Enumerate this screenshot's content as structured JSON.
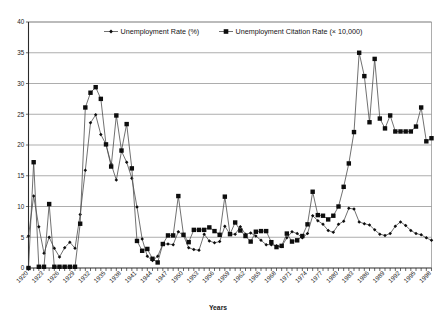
{
  "chart_data": {
    "type": "line",
    "title": "",
    "xlabel": "Years",
    "ylabel": "",
    "xlim": [
      1920,
      1998
    ],
    "ylim": [
      0,
      40
    ],
    "yticks": [
      0,
      5,
      10,
      15,
      20,
      25,
      30,
      35,
      40
    ],
    "grid": true,
    "legend_position": "top-inside",
    "xtick_step": 3,
    "xtick_labels": [
      "1920",
      "1923",
      "1926",
      "1929",
      "1932",
      "1935",
      "1938",
      "1941",
      "1944",
      "1947",
      "1950",
      "1953",
      "1956",
      "1959",
      "1962",
      "1965",
      "1968",
      "1971",
      "1974",
      "1977",
      "1980",
      "1983",
      "1986",
      "1989",
      "1992",
      "1995",
      "1998"
    ],
    "x": [
      1920,
      1921,
      1922,
      1923,
      1924,
      1925,
      1926,
      1927,
      1928,
      1929,
      1930,
      1931,
      1932,
      1933,
      1934,
      1935,
      1936,
      1937,
      1938,
      1939,
      1940,
      1941,
      1942,
      1943,
      1944,
      1945,
      1946,
      1947,
      1948,
      1949,
      1950,
      1951,
      1952,
      1953,
      1954,
      1955,
      1956,
      1957,
      1958,
      1959,
      1960,
      1961,
      1962,
      1963,
      1964,
      1965,
      1966,
      1967,
      1968,
      1969,
      1970,
      1971,
      1972,
      1973,
      1974,
      1975,
      1976,
      1977,
      1978,
      1979,
      1980,
      1981,
      1982,
      1983,
      1984,
      1985,
      1986,
      1987,
      1988,
      1989,
      1990,
      1991,
      1992,
      1993,
      1994,
      1995,
      1996,
      1997,
      1998
    ],
    "series": [
      {
        "name": "Unemployment Rate (%)",
        "marker": "diamond",
        "values": [
          5.2,
          11.7,
          6.7,
          2.4,
          5.0,
          3.2,
          1.8,
          3.3,
          4.2,
          3.2,
          8.7,
          15.9,
          23.6,
          24.9,
          21.7,
          20.1,
          16.9,
          14.3,
          19.0,
          17.2,
          14.6,
          9.9,
          4.7,
          1.9,
          1.2,
          1.9,
          3.9,
          3.9,
          3.8,
          5.9,
          5.3,
          3.3,
          3.0,
          2.9,
          5.5,
          4.4,
          4.1,
          4.3,
          6.8,
          5.5,
          5.5,
          6.7,
          5.5,
          5.7,
          5.2,
          4.5,
          3.8,
          3.8,
          3.6,
          3.5,
          4.9,
          5.9,
          5.6,
          4.9,
          5.6,
          8.5,
          7.7,
          7.1,
          6.1,
          5.8,
          7.1,
          7.6,
          9.7,
          9.6,
          7.5,
          7.2,
          7.0,
          6.2,
          5.5,
          5.3,
          5.6,
          6.8,
          7.5,
          6.9,
          6.1,
          5.6,
          5.4,
          4.9,
          4.5
        ]
      },
      {
        "name": "Unemployment Citation Rate (× 10,000)",
        "marker": "square",
        "values": [
          0.0,
          17.2,
          0.2,
          0.2,
          10.4,
          0.2,
          0.2,
          0.2,
          0.2,
          0.2,
          7.2,
          26.1,
          28.5,
          29.4,
          27.5,
          20.1,
          16.5,
          24.8,
          19.1,
          23.4,
          16.2,
          4.4,
          2.8,
          3.1,
          1.5,
          0.9,
          3.9,
          5.3,
          5.3,
          11.7,
          5.4,
          4.2,
          6.2,
          6.2,
          6.2,
          6.6,
          6.0,
          5.4,
          11.6,
          5.5,
          7.4,
          6.1,
          5.2,
          4.3,
          5.9,
          6.0,
          6.0,
          4.2,
          3.4,
          3.6,
          5.6,
          4.3,
          4.5,
          5.2,
          7.1,
          12.4,
          8.6,
          8.5,
          7.9,
          8.5,
          10.0,
          13.2,
          17.0,
          22.1,
          35.0,
          31.2,
          23.7,
          34.0,
          24.3,
          22.7,
          24.8,
          22.2,
          22.2,
          22.2,
          22.2,
          23.0,
          26.1,
          20.6,
          21.1
        ]
      }
    ]
  },
  "legend": {
    "entries": [
      {
        "label": "Unemployment Rate (%)",
        "marker": "diamond-marker"
      },
      {
        "label": "Unemployment Citation Rate (× 10,000)",
        "marker": "square-marker"
      }
    ]
  },
  "axes": {
    "x_title": "Years"
  },
  "colors": {
    "line": "#4d4d4d",
    "marker": "#0d0d0d",
    "grid": "#8a8a8a",
    "axis": "#2a2a2a",
    "background": "#ffffff"
  }
}
